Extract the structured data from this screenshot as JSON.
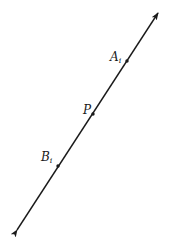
{
  "diagram": {
    "type": "line-with-points",
    "line": {
      "start": [
        17,
        230
      ],
      "end": [
        158,
        13
      ],
      "arrows": "both",
      "color": "#1a1a1a"
    },
    "points": [
      {
        "name": "A",
        "subscript": "i",
        "x": 127,
        "y": 61
      },
      {
        "name": "P",
        "subscript": "",
        "x": 93,
        "y": 114
      },
      {
        "name": "B",
        "subscript": "i",
        "x": 58,
        "y": 166
      }
    ]
  },
  "labels": {
    "a": {
      "main": "A",
      "sub": "i"
    },
    "p": {
      "main": "P",
      "sub": ""
    },
    "b": {
      "main": "B",
      "sub": "i"
    }
  }
}
